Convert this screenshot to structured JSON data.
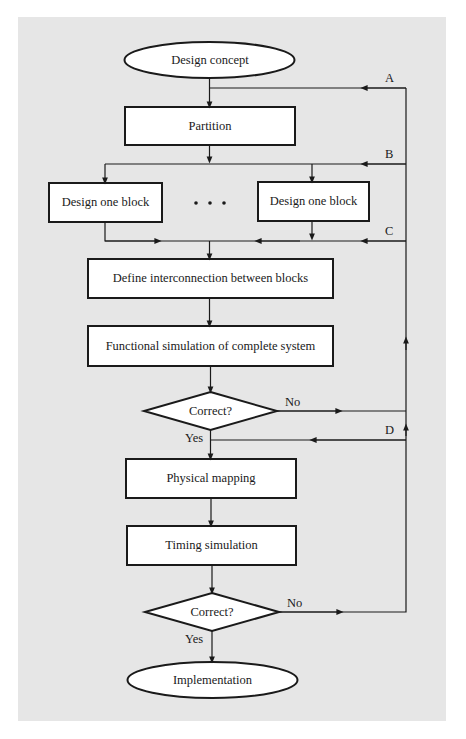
{
  "diagram": {
    "type": "flowchart",
    "background_color": "#e6e6e6",
    "node_fill": "#ffffff",
    "stroke_color": "#1a1a1a",
    "nodes": {
      "start": {
        "shape": "ellipse",
        "label": "Design concept"
      },
      "partition": {
        "shape": "rect",
        "label": "Partition"
      },
      "block_left": {
        "shape": "rect",
        "label": "Design one block"
      },
      "ellipsis": {
        "shape": "dots",
        "label": "· · ·"
      },
      "block_right": {
        "shape": "rect",
        "label": "Design one block"
      },
      "define": {
        "shape": "rect",
        "label": "Define interconnection between blocks"
      },
      "functional": {
        "shape": "rect",
        "label": "Functional simulation of complete system"
      },
      "decision1": {
        "shape": "diamond",
        "label": "Correct?"
      },
      "physical": {
        "shape": "rect",
        "label": "Physical mapping"
      },
      "timing": {
        "shape": "rect",
        "label": "Timing simulation"
      },
      "decision2": {
        "shape": "diamond",
        "label": "Correct?"
      },
      "end": {
        "shape": "ellipse",
        "label": "Implementation"
      }
    },
    "edge_labels": {
      "decision1_no": "No",
      "decision1_yes": "Yes",
      "decision2_no": "No",
      "decision2_yes": "Yes"
    },
    "feedback_labels": {
      "a": "A",
      "b": "B",
      "c": "C",
      "d": "D"
    },
    "edges": [
      {
        "from": "start",
        "to": "partition"
      },
      {
        "from": "partition",
        "to": "block_left"
      },
      {
        "from": "partition",
        "to": "block_right"
      },
      {
        "from": "block_left",
        "to": "define"
      },
      {
        "from": "block_right",
        "to": "define"
      },
      {
        "from": "define",
        "to": "functional"
      },
      {
        "from": "functional",
        "to": "decision1"
      },
      {
        "from": "decision1",
        "to": "physical",
        "label": "Yes"
      },
      {
        "from": "decision1",
        "to": "feedback_bus",
        "label": "No"
      },
      {
        "from": "physical",
        "to": "timing"
      },
      {
        "from": "timing",
        "to": "decision2"
      },
      {
        "from": "decision2",
        "to": "end",
        "label": "Yes"
      },
      {
        "from": "decision2",
        "to": "feedback_bus",
        "label": "No"
      },
      {
        "from": "feedback_bus",
        "to": "partition",
        "label": "A"
      },
      {
        "from": "feedback_bus",
        "to": "block_left",
        "label": "B"
      },
      {
        "from": "feedback_bus",
        "to": "block_right",
        "label": "B"
      },
      {
        "from": "feedback_bus",
        "to": "define",
        "label": "C"
      },
      {
        "from": "feedback_bus",
        "to": "physical",
        "label": "D"
      }
    ]
  }
}
